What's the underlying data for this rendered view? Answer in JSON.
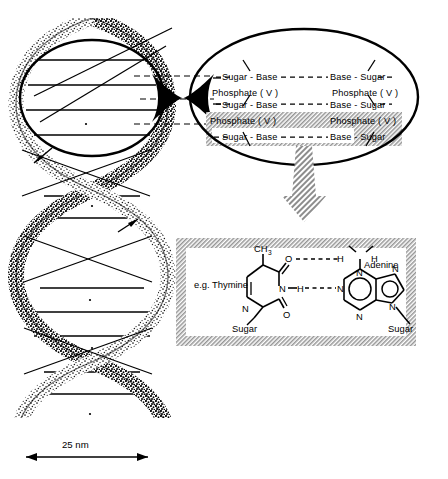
{
  "figure": {
    "background_color": "#ffffff",
    "ink_color": "#000000",
    "hatch_color": "#9a9a9a"
  },
  "helix": {
    "name": "dna-double-helix",
    "scale_bar": {
      "label": "25 nm",
      "length_px": 122,
      "arrow_style": "double-headed"
    },
    "direction_arrows": 2,
    "rungs_note": "horizontal base-pair rungs between the two stippled strands"
  },
  "callout": {
    "name": "backbone-callout-ellipse",
    "rows": [
      {
        "left": "Sugar - Base",
        "right": "Base - Sugar",
        "link": "- - - - - - -"
      },
      {
        "left": "Sugar - Base",
        "right": "Base - Sugar",
        "link": "- - - - - - -"
      },
      {
        "left": "Sugar - Base",
        "right": "Base - Sugar",
        "link": "- - - - - - -"
      }
    ],
    "phosphates": [
      {
        "left": "Phosphate ( V )",
        "right": "Phosphate ( V )"
      },
      {
        "left": "Phosphate ( V )",
        "right": "Phosphate ( V )"
      }
    ]
  },
  "detail_box": {
    "name": "base-pair-detail-box",
    "left_base_label": "e.g. Thymine",
    "right_base_label": "Adenine",
    "sugar_left": "Sugar",
    "sugar_right": "Sugar",
    "atoms": {
      "methyl": "CH",
      "methyl_sub": "3",
      "oxygen_top": "O",
      "oxygen_bottom": "O",
      "n_thymine_top": "N",
      "n_thymine_bottom": "N",
      "h_thymine": "H",
      "h_amine_left": "H",
      "h_amine_right": "H",
      "n_amine": "N",
      "n_adenine_1": "N",
      "n_adenine_2": "N",
      "n_adenine_3": "N",
      "n_adenine_4": "N"
    },
    "hydrogen_bonds": [
      {
        "from": "O",
        "to": "H",
        "style": "dashed"
      },
      {
        "from": "H",
        "to": "N",
        "style": "dashed"
      }
    ]
  }
}
